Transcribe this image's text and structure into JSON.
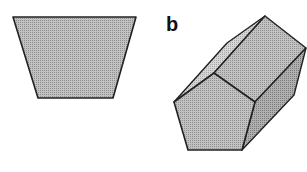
{
  "figure": {
    "panel_b_label": "b",
    "shapes": [
      {
        "name": "trapezoid",
        "description": "2D projection (trapezoid)",
        "fill": "#b8b8b8"
      },
      {
        "name": "pentagonal-prism",
        "description": "3D pentagonal prism",
        "fill_front": "#b0b0b0",
        "fill_top": "#c4c4c4",
        "fill_side": "#9c9c9c",
        "fill_back": "#d0d0d0"
      }
    ],
    "stroke_color": "#222222"
  }
}
